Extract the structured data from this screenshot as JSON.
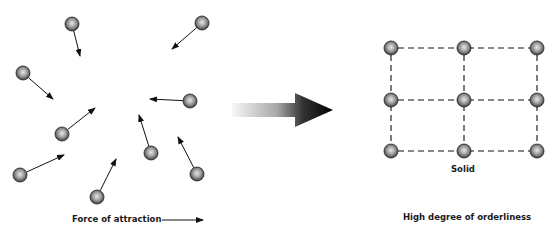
{
  "figure": {
    "left_panel": {
      "caption": "Force of attraction",
      "particles": [
        {
          "cx": 72,
          "cy": 24,
          "ax": 80,
          "ay": 56
        },
        {
          "cx": 23,
          "cy": 73,
          "ax": 53,
          "ay": 99
        },
        {
          "cx": 202,
          "cy": 23,
          "ax": 172,
          "ay": 49
        },
        {
          "cx": 190,
          "cy": 101,
          "ax": 150,
          "ay": 99
        },
        {
          "cx": 62,
          "cy": 134,
          "ax": 95,
          "ay": 108
        },
        {
          "cx": 20,
          "cy": 175,
          "ax": 64,
          "ay": 155
        },
        {
          "cx": 151,
          "cy": 153,
          "ax": 139,
          "ay": 115
        },
        {
          "cx": 197,
          "cy": 174,
          "ax": 178,
          "ay": 137
        },
        {
          "cx": 97,
          "cy": 197,
          "ax": 116,
          "ay": 159
        }
      ]
    },
    "transition_arrow": {
      "from_x": 232,
      "to_x": 333,
      "y": 110
    },
    "right_panel": {
      "state_label": "Solid",
      "caption": "High degree of orderliness",
      "grid": {
        "columns_x": [
          391,
          464,
          537
        ],
        "rows_y": [
          48,
          100,
          151
        ]
      }
    }
  }
}
